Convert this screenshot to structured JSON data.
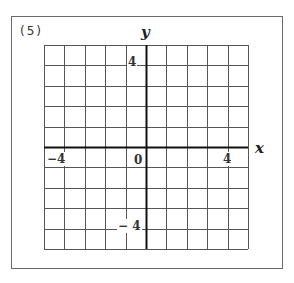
{
  "problem": {
    "number_label": "(5)"
  },
  "grid": {
    "rows": 10,
    "cols": 10,
    "left": 44,
    "top": 45,
    "cell": 20.4,
    "grid_color": "#555555",
    "axis_color": "#111111"
  },
  "axes": {
    "x_label": "x",
    "y_label": "y",
    "origin_label": "0",
    "x_pos_tick": "4",
    "x_neg_tick": "−4",
    "y_pos_tick": "4",
    "y_neg_tick": "− 4",
    "x_range": [
      -5,
      5
    ],
    "y_range": [
      -5,
      5
    ]
  }
}
